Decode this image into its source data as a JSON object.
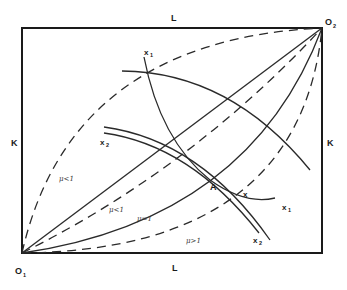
{
  "diagram": {
    "type": "edgeworth-box",
    "labels": {
      "top_axis": "L",
      "bottom_axis": "L",
      "left_axis": "K",
      "right_axis": "K",
      "origin_1": "O",
      "origin_1_sub": "1",
      "origin_2": "O",
      "origin_2_sub": "2",
      "point_a": "A",
      "point_x": "x"
    },
    "curve_labels": {
      "x1_top": "x",
      "x1_top_sub": "1",
      "x1_right": "x",
      "x1_right_sub": "1",
      "x2_left": "x",
      "x2_left_sub": "2",
      "x2_bottom": "x",
      "x2_bottom_sub": "2"
    },
    "mu_labels": {
      "outer_left": "μ<1",
      "inner_left": "μ<1",
      "middle": "μ=1",
      "lower_right": "μ>1"
    },
    "colors": {
      "ink": "#1a1a1a",
      "background": "#ffffff"
    }
  }
}
